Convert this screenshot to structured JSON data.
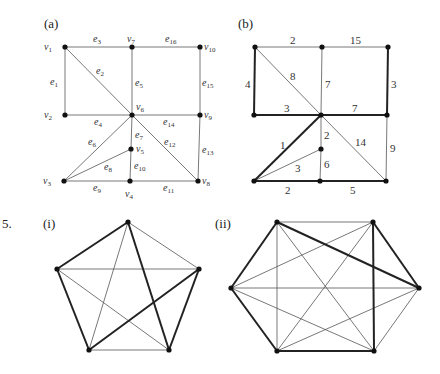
{
  "problem_number": "5.",
  "panels": {
    "a": {
      "label": "(a)",
      "label_pos": [
        44,
        28
      ],
      "vertices": [
        {
          "id": "v1",
          "name": "v",
          "sub": "1",
          "x": 65,
          "y": 47,
          "lx": 44,
          "ly": 50
        },
        {
          "id": "v2",
          "name": "v",
          "sub": "2",
          "x": 65,
          "y": 115,
          "lx": 44,
          "ly": 118
        },
        {
          "id": "v3",
          "name": "v",
          "sub": "3",
          "x": 64,
          "y": 181,
          "lx": 43,
          "ly": 184
        },
        {
          "id": "v4",
          "name": "v",
          "sub": "4",
          "x": 130,
          "y": 181,
          "lx": 125,
          "ly": 197
        },
        {
          "id": "v5",
          "name": "v",
          "sub": "5",
          "x": 131,
          "y": 149,
          "lx": 136,
          "ly": 152
        },
        {
          "id": "v6",
          "name": "v",
          "sub": "6",
          "x": 132,
          "y": 115,
          "lx": 136,
          "ly": 110
        },
        {
          "id": "v7",
          "name": "v",
          "sub": "7",
          "x": 132,
          "y": 47,
          "lx": 127,
          "ly": 42
        },
        {
          "id": "v8",
          "name": "v",
          "sub": "8",
          "x": 198,
          "y": 181,
          "lx": 202,
          "ly": 184
        },
        {
          "id": "v9",
          "name": "v",
          "sub": "9",
          "x": 200,
          "y": 115,
          "lx": 204,
          "ly": 118
        },
        {
          "id": "v10",
          "name": "v",
          "sub": "10",
          "x": 200,
          "y": 47,
          "lx": 204,
          "ly": 50
        }
      ],
      "edges": [
        {
          "id": "e1",
          "from": "v1",
          "to": "v2",
          "label": "e",
          "sub": "1",
          "lx": 50,
          "ly": 85
        },
        {
          "id": "e2",
          "from": "v1",
          "to": "v6",
          "label": "e",
          "sub": "2",
          "lx": 96,
          "ly": 74
        },
        {
          "id": "e3",
          "from": "v1",
          "to": "v7",
          "label": "e",
          "sub": "3",
          "lx": 93,
          "ly": 42
        },
        {
          "id": "e4",
          "from": "v2",
          "to": "v6",
          "label": "e",
          "sub": "4",
          "lx": 94,
          "ly": 125
        },
        {
          "id": "e5",
          "from": "v7",
          "to": "v6",
          "label": "e",
          "sub": "5",
          "lx": 135,
          "ly": 86
        },
        {
          "id": "e6",
          "from": "v3",
          "to": "v6",
          "label": "e",
          "sub": "6",
          "lx": 88,
          "ly": 145
        },
        {
          "id": "e7",
          "from": "v6",
          "to": "v5",
          "label": "e",
          "sub": "7",
          "lx": 135,
          "ly": 138
        },
        {
          "id": "e8",
          "from": "v3",
          "to": "v5",
          "label": "e",
          "sub": "8",
          "lx": 104,
          "ly": 170
        },
        {
          "id": "e9",
          "from": "v3",
          "to": "v4",
          "label": "e",
          "sub": "9",
          "lx": 93,
          "ly": 191
        },
        {
          "id": "e10",
          "from": "v5",
          "to": "v4",
          "label": "e",
          "sub": "10",
          "lx": 134,
          "ly": 169
        },
        {
          "id": "e11",
          "from": "v4",
          "to": "v8",
          "label": "e",
          "sub": "11",
          "lx": 163,
          "ly": 191
        },
        {
          "id": "e12",
          "from": "v6",
          "to": "v8",
          "label": "e",
          "sub": "12",
          "lx": 164,
          "ly": 145
        },
        {
          "id": "e13",
          "from": "v9",
          "to": "v8",
          "label": "e",
          "sub": "13",
          "lx": 202,
          "ly": 153
        },
        {
          "id": "e14",
          "from": "v6",
          "to": "v9",
          "label": "e",
          "sub": "14",
          "lx": 163,
          "ly": 125
        },
        {
          "id": "e15",
          "from": "v10",
          "to": "v9",
          "label": "e",
          "sub": "15",
          "lx": 202,
          "ly": 86
        },
        {
          "id": "e16",
          "from": "v7",
          "to": "v10",
          "label": "e",
          "sub": "16",
          "lx": 165,
          "ly": 42
        }
      ]
    },
    "b": {
      "label": "(b)",
      "label_pos": [
        238,
        28
      ],
      "vertices": [
        {
          "id": "p1",
          "x": 255,
          "y": 47
        },
        {
          "id": "p7",
          "x": 322,
          "y": 47
        },
        {
          "id": "p10",
          "x": 388,
          "y": 47
        },
        {
          "id": "p2",
          "x": 254,
          "y": 115
        },
        {
          "id": "p6",
          "x": 321,
          "y": 115
        },
        {
          "id": "p9",
          "x": 387,
          "y": 115
        },
        {
          "id": "p5",
          "x": 321,
          "y": 149
        },
        {
          "id": "p3",
          "x": 254,
          "y": 181
        },
        {
          "id": "p4",
          "x": 320,
          "y": 181
        },
        {
          "id": "p8",
          "x": 386,
          "y": 181
        }
      ],
      "edges": [
        {
          "from": "p1",
          "to": "p7",
          "weight": "2",
          "bold": false,
          "lx": 290,
          "ly": 44
        },
        {
          "from": "p7",
          "to": "p10",
          "weight": "15",
          "bold": false,
          "lx": 350,
          "ly": 44
        },
        {
          "from": "p1",
          "to": "p2",
          "weight": "4",
          "bold": true,
          "lx": 245,
          "ly": 88
        },
        {
          "from": "p1",
          "to": "p6",
          "weight": "8",
          "bold": false,
          "lx": 290,
          "ly": 80
        },
        {
          "from": "p7",
          "to": "p6",
          "weight": "7",
          "bold": false,
          "lx": 325,
          "ly": 88
        },
        {
          "from": "p10",
          "to": "p9",
          "weight": "3",
          "bold": true,
          "lx": 391,
          "ly": 88
        },
        {
          "from": "p2",
          "to": "p6",
          "weight": "3",
          "bold": true,
          "lx": 284,
          "ly": 112
        },
        {
          "from": "p6",
          "to": "p9",
          "weight": "7",
          "bold": true,
          "lx": 352,
          "ly": 112
        },
        {
          "from": "p6",
          "to": "p3",
          "weight": "1",
          "bold": true,
          "lx": 280,
          "ly": 149
        },
        {
          "from": "p6",
          "to": "p5",
          "weight": "2",
          "bold": false,
          "lx": 324,
          "ly": 139
        },
        {
          "from": "p6",
          "to": "p8",
          "weight": "14",
          "bold": false,
          "lx": 355,
          "ly": 146
        },
        {
          "from": "p9",
          "to": "p8",
          "weight": "9",
          "bold": false,
          "lx": 390,
          "ly": 152
        },
        {
          "from": "p3",
          "to": "p5",
          "weight": "3",
          "bold": false,
          "lx": 295,
          "ly": 172
        },
        {
          "from": "p5",
          "to": "p4",
          "weight": "6",
          "bold": false,
          "lx": 324,
          "ly": 168
        },
        {
          "from": "p3",
          "to": "p4",
          "weight": "2",
          "bold": true,
          "lx": 285,
          "ly": 194
        },
        {
          "from": "p4",
          "to": "p8",
          "weight": "5",
          "bold": true,
          "lx": 350,
          "ly": 194
        }
      ]
    },
    "i": {
      "label": "(i)",
      "label_pos": [
        43,
        228
      ],
      "vertices": [
        {
          "id": "T",
          "x": 128,
          "y": 222
        },
        {
          "id": "L",
          "x": 57,
          "y": 269
        },
        {
          "id": "R",
          "x": 199,
          "y": 269
        },
        {
          "id": "BL",
          "x": 89,
          "y": 350
        },
        {
          "id": "BR",
          "x": 169,
          "y": 350
        }
      ],
      "edges": [
        {
          "from": "T",
          "to": "L",
          "bold": true
        },
        {
          "from": "L",
          "to": "BL",
          "bold": true
        },
        {
          "from": "BL",
          "to": "R",
          "bold": true
        },
        {
          "from": "R",
          "to": "BR",
          "bold": true
        },
        {
          "from": "BR",
          "to": "T",
          "bold": true
        },
        {
          "from": "T",
          "to": "R",
          "bold": false
        },
        {
          "from": "T",
          "to": "BL",
          "bold": false
        },
        {
          "from": "L",
          "to": "R",
          "bold": false
        },
        {
          "from": "L",
          "to": "BR",
          "bold": false
        },
        {
          "from": "BL",
          "to": "BR",
          "bold": false
        }
      ]
    },
    "ii": {
      "label": "(ii)",
      "label_pos": [
        215,
        228
      ],
      "vertices": [
        {
          "id": "TL",
          "x": 277,
          "y": 222
        },
        {
          "id": "TR",
          "x": 373,
          "y": 222
        },
        {
          "id": "L",
          "x": 231,
          "y": 288
        },
        {
          "id": "R",
          "x": 419,
          "y": 288
        },
        {
          "id": "BL",
          "x": 277,
          "y": 351
        },
        {
          "id": "BR",
          "x": 374,
          "y": 351
        }
      ],
      "edges": [
        {
          "from": "TL",
          "to": "L",
          "bold": true
        },
        {
          "from": "L",
          "to": "BL",
          "bold": true
        },
        {
          "from": "BL",
          "to": "BR",
          "bold": true
        },
        {
          "from": "BR",
          "to": "TR",
          "bold": true
        },
        {
          "from": "TR",
          "to": "R",
          "bold": true
        },
        {
          "from": "R",
          "to": "TL",
          "bold": true
        },
        {
          "from": "TL",
          "to": "TR",
          "bold": false
        },
        {
          "from": "TL",
          "to": "BL",
          "bold": false
        },
        {
          "from": "TL",
          "to": "BR",
          "bold": false
        },
        {
          "from": "TR",
          "to": "L",
          "bold": false
        },
        {
          "from": "TR",
          "to": "BL",
          "bold": false
        },
        {
          "from": "L",
          "to": "R",
          "bold": false
        },
        {
          "from": "L",
          "to": "BR",
          "bold": false
        },
        {
          "from": "R",
          "to": "BL",
          "bold": false
        },
        {
          "from": "R",
          "to": "BR",
          "bold": false
        }
      ]
    }
  }
}
